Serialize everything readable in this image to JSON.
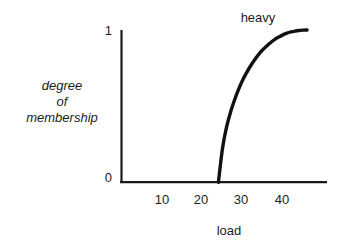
{
  "figure": {
    "background_color": "#ffffff",
    "ink_color": "#1a1a1a"
  },
  "axes": {
    "y_ticks": [
      {
        "label": "1",
        "value": 1
      },
      {
        "label": "0",
        "value": 0
      }
    ],
    "x_ticks": [
      {
        "label": "10",
        "value": 10
      },
      {
        "label": "20",
        "value": 20
      },
      {
        "label": "30",
        "value": 30
      },
      {
        "label": "40",
        "value": 40
      }
    ],
    "x_title": "load",
    "y_title_lines": [
      "degree",
      "of",
      "membership"
    ]
  },
  "annotations": {
    "curve_label": "heavy"
  },
  "chart_data": {
    "type": "line",
    "title": "",
    "subtitle": "",
    "xlabel": "load",
    "ylabel": "degree of membership",
    "xlim": [
      0,
      48
    ],
    "ylim": [
      0,
      1
    ],
    "grid": false,
    "legend": false,
    "annotations": [
      {
        "text": "heavy",
        "x": 33,
        "y": 1.08
      }
    ],
    "series": [
      {
        "name": "heavy",
        "color": "#111111",
        "line_width": 3,
        "x": [
          24,
          25,
          26,
          27,
          28,
          29,
          30,
          31,
          32,
          33,
          34,
          35,
          36,
          37,
          38,
          39,
          40,
          41,
          42,
          43,
          44,
          45,
          46
        ],
        "y": [
          0.0,
          0.22,
          0.36,
          0.46,
          0.54,
          0.61,
          0.67,
          0.72,
          0.765,
          0.805,
          0.84,
          0.87,
          0.895,
          0.918,
          0.938,
          0.954,
          0.968,
          0.979,
          0.987,
          0.993,
          0.997,
          0.999,
          1.0
        ]
      }
    ]
  }
}
